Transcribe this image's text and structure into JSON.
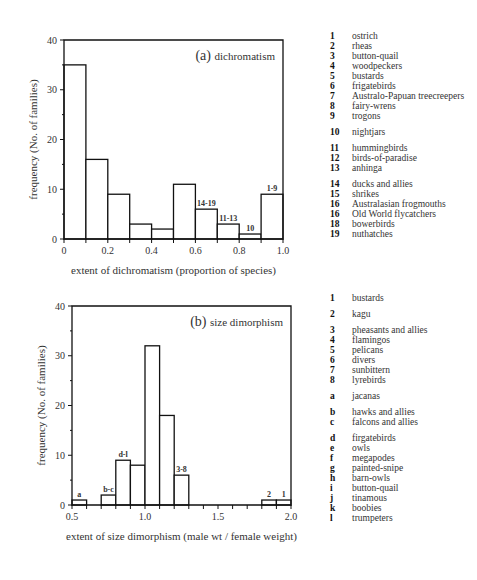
{
  "chart_data": [
    {
      "type": "bar",
      "title": "(a) dichromatism",
      "panel_label": "(a)",
      "panel_title": "dichromatism",
      "xlabel": "extent of  dichromatism (proportion of species)",
      "ylabel": "frequency (No. of families)",
      "xlim": [
        0,
        1.0
      ],
      "ylim": [
        0,
        40
      ],
      "xticks": [
        "0",
        "0.2",
        "0.4",
        "0.6",
        "0.8",
        "1.0"
      ],
      "yticks": [
        "0",
        "10",
        "20",
        "30",
        "40"
      ],
      "bin_width": 0.1,
      "bins": [
        {
          "x0": 0.0,
          "x1": 0.1,
          "value": 35,
          "label": ""
        },
        {
          "x0": 0.1,
          "x1": 0.2,
          "value": 16,
          "label": ""
        },
        {
          "x0": 0.2,
          "x1": 0.3,
          "value": 9,
          "label": ""
        },
        {
          "x0": 0.3,
          "x1": 0.4,
          "value": 3,
          "label": ""
        },
        {
          "x0": 0.4,
          "x1": 0.5,
          "value": 2,
          "label": ""
        },
        {
          "x0": 0.5,
          "x1": 0.6,
          "value": 11,
          "label": ""
        },
        {
          "x0": 0.6,
          "x1": 0.7,
          "value": 6,
          "label": "14-19"
        },
        {
          "x0": 0.7,
          "x1": 0.8,
          "value": 3,
          "label": "11-13"
        },
        {
          "x0": 0.8,
          "x1": 0.9,
          "value": 1,
          "label": "10"
        },
        {
          "x0": 0.9,
          "x1": 1.0,
          "value": 9,
          "label": "1-9"
        }
      ],
      "grid": false,
      "legend_position": "right"
    },
    {
      "type": "bar",
      "title": "(b) size dimorphism",
      "panel_label": "(b)",
      "panel_title": "size dimorphism",
      "xlabel": "extent of  size dimorphism (male wt / female weight)",
      "ylabel": "frequency (No. of families)",
      "xlim": [
        0.5,
        2.0
      ],
      "ylim": [
        0,
        40
      ],
      "xticks": [
        "0.5",
        "1.0",
        "1.5",
        "2.0"
      ],
      "yticks": [
        "0",
        "10",
        "20",
        "30",
        "40"
      ],
      "bin_width": 0.1,
      "bins": [
        {
          "x0": 0.5,
          "x1": 0.6,
          "value": 1,
          "label": "a"
        },
        {
          "x0": 0.6,
          "x1": 0.7,
          "value": 0,
          "label": ""
        },
        {
          "x0": 0.7,
          "x1": 0.8,
          "value": 2,
          "label": "b-c"
        },
        {
          "x0": 0.8,
          "x1": 0.9,
          "value": 9,
          "label": "d-l"
        },
        {
          "x0": 0.9,
          "x1": 1.0,
          "value": 8,
          "label": ""
        },
        {
          "x0": 1.0,
          "x1": 1.1,
          "value": 32,
          "label": ""
        },
        {
          "x0": 1.1,
          "x1": 1.2,
          "value": 18,
          "label": ""
        },
        {
          "x0": 1.2,
          "x1": 1.3,
          "value": 6,
          "label": "3-8"
        },
        {
          "x0": 1.8,
          "x1": 1.9,
          "value": 1,
          "label": "2"
        },
        {
          "x0": 1.9,
          "x1": 2.0,
          "value": 1,
          "label": "1"
        }
      ],
      "grid": false,
      "legend_position": "right"
    }
  ],
  "legend_a": [
    [
      {
        "k": "1",
        "v": "ostrich"
      },
      {
        "k": "2",
        "v": "rheas"
      },
      {
        "k": "3",
        "v": "button-quail"
      },
      {
        "k": "4",
        "v": "woodpeckers"
      },
      {
        "k": "5",
        "v": "bustards"
      },
      {
        "k": "6",
        "v": "frigatebirds"
      },
      {
        "k": "7",
        "v": "Australo-Papuan treecreepers"
      },
      {
        "k": "8",
        "v": "fairy-wrens"
      },
      {
        "k": "9",
        "v": "trogons"
      }
    ],
    [
      {
        "k": "10",
        "v": "nightjars"
      }
    ],
    [
      {
        "k": "11",
        "v": "hummingbirds"
      },
      {
        "k": "12",
        "v": "birds-of-paradise"
      },
      {
        "k": "13",
        "v": "anhinga"
      }
    ],
    [
      {
        "k": "14",
        "v": "ducks and allies"
      },
      {
        "k": "15",
        "v": "shrikes"
      },
      {
        "k": "16",
        "v": "Australasian frogmouths"
      },
      {
        "k": "16",
        "v": "Old World flycatchers"
      },
      {
        "k": "18",
        "v": "bowerbirds"
      },
      {
        "k": "19",
        "v": "nuthatches"
      }
    ]
  ],
  "legend_b": [
    [
      {
        "k": "1",
        "v": "bustards"
      }
    ],
    [
      {
        "k": "2",
        "v": "kagu"
      }
    ],
    [
      {
        "k": "3",
        "v": "pheasants and allies"
      },
      {
        "k": "4",
        "v": "flamingos"
      },
      {
        "k": "5",
        "v": "pelicans"
      },
      {
        "k": "6",
        "v": "divers"
      },
      {
        "k": "7",
        "v": "sunbittern"
      },
      {
        "k": "8",
        "v": "lyrebirds"
      }
    ],
    [
      {
        "k": "a",
        "v": "jacanas"
      }
    ],
    [
      {
        "k": "b",
        "v": "hawks and allies"
      },
      {
        "k": "c",
        "v": "falcons and allies"
      }
    ],
    [
      {
        "k": "d",
        "v": "firgatebirds"
      },
      {
        "k": "e",
        "v": "owls"
      },
      {
        "k": "f",
        "v": "megapodes"
      },
      {
        "k": "g",
        "v": "painted-snipe"
      },
      {
        "k": "h",
        "v": "barn-owls"
      },
      {
        "k": "i",
        "v": "button-quail"
      },
      {
        "k": "j",
        "v": "tinamous"
      },
      {
        "k": "k",
        "v": "boobies"
      },
      {
        "k": "l",
        "v": "trumpeters"
      }
    ]
  ]
}
